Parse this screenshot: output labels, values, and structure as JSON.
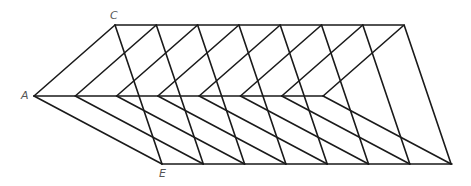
{
  "diagram": {
    "labels": {
      "A": "A",
      "C": "C",
      "E": "E"
    },
    "stroke_color": "#1a1a1a",
    "stroke_width": 1.6,
    "copies": 8,
    "base_triangle": {
      "A": [
        34,
        96
      ],
      "C": [
        115,
        25
      ],
      "E": [
        162,
        164
      ]
    },
    "shift": 41.3,
    "lines": {
      "top": [
        [
          115,
          25
        ],
        [
          403,
          25
        ]
      ],
      "middle": [
        [
          34,
          96
        ],
        [
          324,
          96
        ]
      ],
      "bottom": [
        [
          162,
          164
        ],
        [
          452,
          164
        ]
      ]
    }
  }
}
